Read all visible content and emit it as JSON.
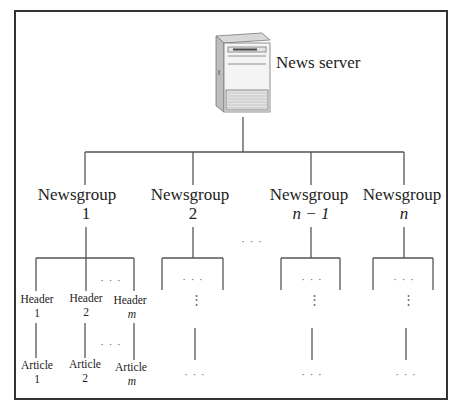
{
  "diagram": {
    "server": {
      "label": "News server",
      "icon": "server-tower-icon"
    },
    "newsgroups": [
      {
        "label": "Newsgroup",
        "number": "1",
        "italic": false
      },
      {
        "label": "Newsgroup",
        "number": "2",
        "italic": false
      },
      {
        "label": "Newsgroup",
        "number": "n − 1",
        "italic": true
      },
      {
        "label": "Newsgroup",
        "number": "n",
        "italic": true
      }
    ],
    "ellipsis": "· · ·",
    "vertical_ellipsis": "⋮",
    "headers": [
      {
        "label": "Header",
        "index": "1",
        "italic": false
      },
      {
        "label": "Header",
        "index": "2",
        "italic": false
      },
      {
        "label": "Header",
        "index": "m",
        "italic": true
      }
    ],
    "articles": [
      {
        "label": "Article",
        "index": "1",
        "italic": false
      },
      {
        "label": "Article",
        "index": "2",
        "italic": false
      },
      {
        "label": "Article",
        "index": "m",
        "italic": true
      }
    ]
  }
}
